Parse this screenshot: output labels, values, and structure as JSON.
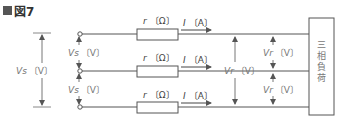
{
  "title": {
    "marker": "■",
    "text": "図7"
  },
  "source_voltage_total": {
    "symbol": "Vs",
    "unit": "〔V〕"
  },
  "source_voltage_phase": [
    {
      "symbol": "Vs",
      "unit": "〔V〕"
    },
    {
      "symbol": "Vs",
      "unit": "〔V〕"
    }
  ],
  "lines": [
    {
      "resistor_symbol": "r",
      "resistor_unit": "〔Ω〕",
      "current_symbol": "I",
      "current_unit": "〔A〕"
    },
    {
      "resistor_symbol": "r",
      "resistor_unit": "〔Ω〕",
      "current_symbol": "I",
      "current_unit": "〔A〕"
    },
    {
      "resistor_symbol": "r",
      "resistor_unit": "〔Ω〕",
      "current_symbol": "I",
      "current_unit": "〔A〕"
    }
  ],
  "receiving_voltage_total": {
    "symbol": "Vr",
    "unit": "〔V〕"
  },
  "receiving_voltage_phase": [
    {
      "symbol": "Vr",
      "unit": "〔V〕"
    },
    {
      "symbol": "Vr",
      "unit": "〔V〕"
    }
  ],
  "load": {
    "label": "三相負荷",
    "chars": [
      "三",
      "相",
      "負",
      "荷"
    ]
  },
  "colors": {
    "wire": "#555555",
    "arrow": "#666666",
    "label": "#777777"
  }
}
